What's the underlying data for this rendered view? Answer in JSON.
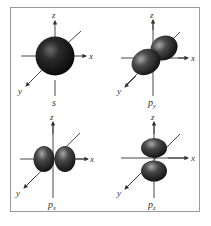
{
  "figure": {
    "panels": [
      {
        "id": "s",
        "caption": "s",
        "caption_sub": "",
        "axes": {
          "x": "x",
          "y": "y",
          "z": "z"
        },
        "shape": "sphere"
      },
      {
        "id": "py",
        "caption": "p",
        "caption_sub": "y",
        "axes": {
          "x": "x",
          "y": "y",
          "z": "z"
        },
        "shape": "dumbbell-along-y"
      },
      {
        "id": "px",
        "caption": "p",
        "caption_sub": "x",
        "axes": {
          "x": "x",
          "y": "y",
          "z": "z"
        },
        "shape": "dumbbell-along-x"
      },
      {
        "id": "pz",
        "caption": "p",
        "caption_sub": "z",
        "axes": {
          "x": "x",
          "y": "y",
          "z": "z"
        },
        "shape": "dumbbell-along-z"
      }
    ],
    "colors": {
      "orbital_dark": "#111111",
      "orbital_mid": "#3a3a3a",
      "orbital_highlight": "#9a9a9a",
      "axis": "#333333",
      "frame": "#9a9a9a"
    }
  }
}
